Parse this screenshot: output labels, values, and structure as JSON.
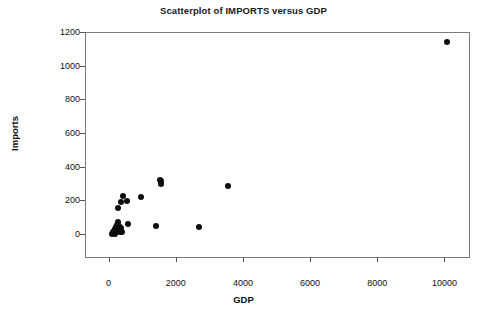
{
  "chart_data": {
    "type": "scatter",
    "title": "Scatterplot of IMPORTS versus GDP",
    "xlabel": "GDP",
    "ylabel": "Imports",
    "xlim": [
      -700,
      10700
    ],
    "ylim": [
      -130,
      1200
    ],
    "xticks": [
      0,
      2000,
      4000,
      6000,
      8000,
      10000
    ],
    "xtick_labels": [
      "0",
      "2000",
      "4000",
      "6000",
      "8000",
      "10000"
    ],
    "yticks": [
      0,
      200,
      400,
      600,
      800,
      1000,
      1200
    ],
    "ytick_labels": [
      "0",
      "200",
      "400",
      "600",
      "800",
      "1000",
      "1200"
    ],
    "grid": false,
    "legend": null,
    "marker": "filled-circle",
    "marker_color": "#0d0d0d",
    "frame_color": "#7a7a7a",
    "background": "#ffffff",
    "points": [
      {
        "x": 60,
        "y": 5
      },
      {
        "x": 90,
        "y": 10
      },
      {
        "x": 110,
        "y": 18
      },
      {
        "x": 130,
        "y": 25
      },
      {
        "x": 150,
        "y": 8
      },
      {
        "x": 170,
        "y": 35
      },
      {
        "x": 185,
        "y": 48
      },
      {
        "x": 205,
        "y": 30
      },
      {
        "x": 230,
        "y": 60
      },
      {
        "x": 250,
        "y": 75
      },
      {
        "x": 270,
        "y": 55
      },
      {
        "x": 300,
        "y": 20
      },
      {
        "x": 330,
        "y": 42
      },
      {
        "x": 360,
        "y": 18
      },
      {
        "x": 255,
        "y": 163
      },
      {
        "x": 340,
        "y": 198
      },
      {
        "x": 400,
        "y": 230
      },
      {
        "x": 520,
        "y": 200
      },
      {
        "x": 540,
        "y": 65
      },
      {
        "x": 950,
        "y": 228
      },
      {
        "x": 1380,
        "y": 57
      },
      {
        "x": 1510,
        "y": 330
      },
      {
        "x": 1530,
        "y": 320
      },
      {
        "x": 1545,
        "y": 303
      },
      {
        "x": 2650,
        "y": 50
      },
      {
        "x": 3520,
        "y": 292
      },
      {
        "x": 10060,
        "y": 1146
      }
    ]
  }
}
